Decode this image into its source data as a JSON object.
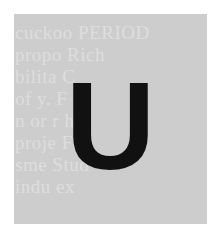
{
  "tile": {
    "letter": "U",
    "background_color": "#cdcdcd",
    "letter_color": "#111111",
    "background_text_lines": [
      "",
      "cuckoo PERIOD",
      "propo  Rich",
      "bilita   C",
      "  of   y. F",
      "n or r   h",
      "proje   Fo",
      "sme   Stud",
      "indu   ex"
    ]
  }
}
